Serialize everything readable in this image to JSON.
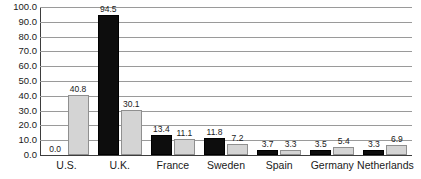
{
  "chart_data": {
    "type": "bar",
    "title": "",
    "subtitle": "",
    "xlabel": "",
    "ylabel": "",
    "categories": [
      "U.S.",
      "U.K.",
      "France",
      "Sweden",
      "Spain",
      "Germany",
      "Netherlands"
    ],
    "series": [
      {
        "name": "series-black",
        "color": "#0d0d0d",
        "values": [
          0.0,
          94.5,
          13.4,
          11.8,
          3.7,
          3.5,
          3.3
        ],
        "labels": [
          "0.0",
          "94.5",
          "13.4",
          "11.8",
          "3.7",
          "3.5",
          "3.3"
        ]
      },
      {
        "name": "series-gray",
        "color": "#d4d4d4",
        "values": [
          40.8,
          30.1,
          11.1,
          7.2,
          3.3,
          5.4,
          6.9
        ],
        "labels": [
          "40.8",
          "30.1",
          "11.1",
          "7.2",
          "3.3",
          "5.4",
          "6.9"
        ]
      }
    ],
    "ylim": [
      0.0,
      100.0
    ],
    "y_tick_step": 10.0,
    "y_ticks": [
      0.0,
      10.0,
      20.0,
      30.0,
      40.0,
      50.0,
      60.0,
      70.0,
      80.0,
      90.0,
      100.0
    ],
    "y_tick_labels": [
      "0.0",
      "10.0",
      "20.0",
      "30.0",
      "40.0",
      "50.0",
      "60.0",
      "70.0",
      "80.0",
      "90.0",
      "100.0"
    ],
    "grid": true,
    "grid_axis": "y",
    "legend": false,
    "legend_position": "none",
    "data_labels": true,
    "annotations": []
  },
  "colors": {
    "background": "#ffffff",
    "gridline": "#9a9a9a",
    "axis": "#3d3d3d",
    "text": "#1a1a1a",
    "series_black_fill": "#0d0d0d",
    "series_black_edge": "#000000",
    "series_gray_fill": "#d4d4d4",
    "series_gray_edge": "#8f8f8f"
  }
}
